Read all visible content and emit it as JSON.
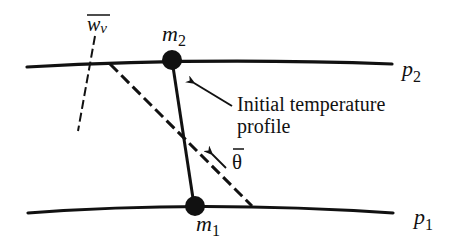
{
  "diagram": {
    "isobars": [
      {
        "id": "p2",
        "label": "p",
        "subscript": "2"
      },
      {
        "id": "p1",
        "label": "p",
        "subscript": "1"
      }
    ],
    "parcels": [
      {
        "id": "m2",
        "label": "m",
        "subscript": "2"
      },
      {
        "id": "m1",
        "label": "m",
        "subscript": "1"
      }
    ],
    "vertical_velocity": {
      "label": "w",
      "subscript": "v",
      "overbar": true
    },
    "mean_theta": {
      "label": "θ",
      "overbar": true
    },
    "annotation": {
      "line1": "Initial temperature",
      "line2": "profile"
    },
    "colors": {
      "ink": "#111111",
      "background": "#ffffff"
    }
  }
}
